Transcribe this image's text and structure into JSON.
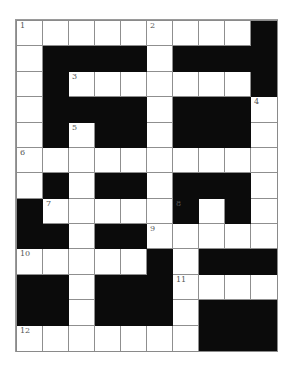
{
  "puzzle": {
    "type": "crossword",
    "rows": 13,
    "cols": 10,
    "colors": {
      "block": "#0b0b0b",
      "cell": "#ffffff",
      "grid_line": "#8f8f8f",
      "number": "#555555"
    },
    "layout": [
      "#########.",
      "#....#....",
      "#.#######.",
      "#....#...#",
      "#.#..#...#",
      "##########",
      "#.#..#...#",
      ".#####.#.#",
      "..#..#####",
      "#####.#...",
      "..#...####",
      "..#...#...",
      "#######..."
    ],
    "layout_legend": "# = white cell, . = black cell",
    "numbers": [
      {
        "label": "1",
        "row": 0,
        "col": 0
      },
      {
        "label": "2",
        "row": 0,
        "col": 5
      },
      {
        "label": "3",
        "row": 2,
        "col": 2
      },
      {
        "label": "4",
        "row": 3,
        "col": 9
      },
      {
        "label": "5",
        "row": 4,
        "col": 2
      },
      {
        "label": "6",
        "row": 5,
        "col": 0
      },
      {
        "label": "7",
        "row": 7,
        "col": 1
      },
      {
        "label": "8",
        "row": 7,
        "col": 6
      },
      {
        "label": "9",
        "row": 8,
        "col": 5
      },
      {
        "label": "10",
        "row": 9,
        "col": 0
      },
      {
        "label": "11",
        "row": 10,
        "col": 6
      },
      {
        "label": "12",
        "row": 12,
        "col": 0
      }
    ]
  }
}
